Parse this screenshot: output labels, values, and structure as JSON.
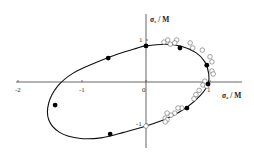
{
  "chart_data": {
    "type": "scatter",
    "title": "",
    "xlabel": "σ₂ / M",
    "ylabel": "σ₁ / M",
    "xlim": [
      -2,
      1.2
    ],
    "ylim": [
      -1.6,
      1.5
    ],
    "grid": false,
    "x_ticks": [
      {
        "value": -2,
        "label": "-2"
      },
      {
        "value": -1,
        "label": "-1"
      },
      {
        "value": 0,
        "label": "0"
      },
      {
        "value": 1,
        "label": "1"
      }
    ],
    "y_ticks": [
      {
        "value": 1,
        "label": "1"
      },
      {
        "value": -1,
        "label": "-1"
      }
    ],
    "series": [
      {
        "name": "filled",
        "marker": "filled-circle",
        "points": [
          [
            0.0,
            0.86
          ],
          [
            -0.59,
            0.57
          ],
          [
            0.53,
            0.81
          ],
          [
            0.95,
            0.4
          ],
          [
            0.97,
            -0.05
          ],
          [
            0.64,
            -0.62
          ],
          [
            -1.42,
            -0.55
          ],
          [
            -0.56,
            -1.24
          ]
        ]
      },
      {
        "name": "open",
        "marker": "open-circle",
        "points": [
          [
            0.28,
            0.95
          ],
          [
            0.34,
            1.0
          ],
          [
            0.38,
            0.9
          ],
          [
            0.48,
            1.0
          ],
          [
            0.45,
            0.93
          ],
          [
            0.69,
            0.93
          ],
          [
            0.73,
            0.81
          ],
          [
            0.88,
            0.76
          ],
          [
            1.0,
            0.6
          ],
          [
            1.03,
            0.48
          ],
          [
            1.03,
            0.26
          ],
          [
            1.05,
            0.19
          ],
          [
            0.92,
            0.02
          ],
          [
            0.89,
            -0.07
          ],
          [
            0.95,
            -0.1
          ],
          [
            0.83,
            -0.2
          ],
          [
            0.78,
            -0.3
          ],
          [
            0.75,
            -0.4
          ],
          [
            0.56,
            -0.62
          ],
          [
            0.5,
            -0.62
          ],
          [
            0.45,
            -0.74
          ],
          [
            0.39,
            -0.79
          ],
          [
            0.33,
            -0.74
          ],
          [
            0.3,
            -0.86
          ],
          [
            0.33,
            -0.9
          ],
          [
            0.3,
            -0.95
          ],
          [
            0.0,
            -1.05
          ]
        ]
      }
    ],
    "curve": {
      "name": "yield-surface",
      "points": [
        [
          0.0,
          0.86
        ],
        [
          0.3,
          0.9
        ],
        [
          0.55,
          0.85
        ],
        [
          0.78,
          0.7
        ],
        [
          0.92,
          0.48
        ],
        [
          0.98,
          0.2
        ],
        [
          0.97,
          -0.05
        ],
        [
          0.85,
          -0.32
        ],
        [
          0.64,
          -0.6
        ],
        [
          0.35,
          -0.85
        ],
        [
          0.0,
          -1.05
        ],
        [
          -0.35,
          -1.2
        ],
        [
          -0.7,
          -1.33
        ],
        [
          -1.05,
          -1.34
        ],
        [
          -1.35,
          -1.2
        ],
        [
          -1.52,
          -0.9
        ],
        [
          -1.52,
          -0.5
        ],
        [
          -1.38,
          -0.1
        ],
        [
          -1.15,
          0.2
        ],
        [
          -0.8,
          0.45
        ],
        [
          -0.45,
          0.66
        ],
        [
          -0.15,
          0.8
        ],
        [
          0.0,
          0.86
        ]
      ]
    }
  }
}
